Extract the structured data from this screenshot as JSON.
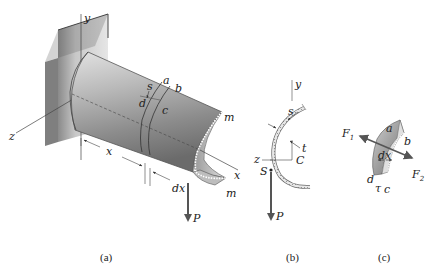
{
  "figure": {
    "panels": [
      {
        "id": "a",
        "caption": "(a)"
      },
      {
        "id": "b",
        "caption": "(b)"
      },
      {
        "id": "c",
        "caption": "(c)"
      }
    ],
    "panel_a": {
      "axis_y": "y",
      "axis_z": "z",
      "axis_x": "x",
      "label_s": "s",
      "label_a": "a",
      "label_b": "b",
      "label_c": "c",
      "label_d": "d",
      "label_m_top": "m",
      "label_m_bottom": "m",
      "dim_x": "x",
      "dim_dx": "dx",
      "load_P": "P"
    },
    "panel_b": {
      "axis_y": "y",
      "axis_z": "z",
      "label_s": "s",
      "label_t": "t",
      "label_C": "C",
      "label_S": "S",
      "load_P": "P"
    },
    "panel_c": {
      "label_a": "a",
      "label_b": "b",
      "label_c": "c",
      "label_d": "d",
      "label_dx": "dx",
      "label_tau": "τ",
      "force_F1": "F",
      "force_F1_sub": "1",
      "force_F2": "F",
      "force_F2_sub": "2"
    }
  }
}
